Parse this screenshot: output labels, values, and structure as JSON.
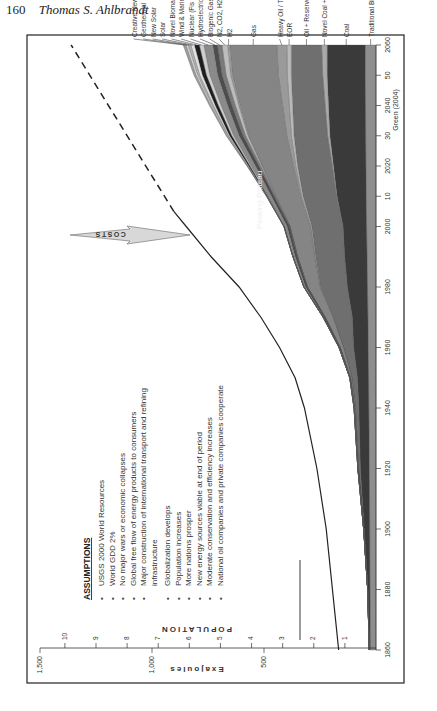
{
  "page_header": {
    "page_number": "160",
    "author": "Thomas S. Ahlbrandt"
  },
  "figure": {
    "orientation": "rotated-90-ccw",
    "source_credit": "Green (2004)",
    "annotation_peaking": "Peaking Plateau",
    "annotation_costs": "COSTS",
    "assumptions": {
      "title": "ASSUMPTIONS",
      "items": [
        "USGS 2000 World Resources",
        "World GDD 2%",
        "No major wars or economic collapses",
        "Global free flow of energy products to consumers",
        "Major construction of international transport and refining infrastructure",
        "Globalization develops",
        "Population increases",
        "More nations prosper",
        "New energy sources viable at end of period",
        "Moderate conservation and efficiency increases",
        "National oil companies and private companies cooperate"
      ]
    }
  },
  "chart_data": {
    "type": "area",
    "stacked": true,
    "title": "",
    "xlabel": "",
    "ylabel": "Exajoules",
    "y2label": "POPULATION",
    "xlim": [
      1860,
      2060
    ],
    "ylim": [
      0,
      1500
    ],
    "y2lim": [
      0,
      10.8
    ],
    "x_ticks": [
      "1860",
      "1880",
      "1900",
      "1920",
      "1940",
      "1960",
      "1980",
      "2000",
      "10",
      "2020",
      "30",
      "2040",
      "50",
      "2060"
    ],
    "y_ticks": [
      "500",
      "1,000",
      "1,500"
    ],
    "y2_ticks": [
      "1",
      "2",
      "3",
      "4",
      "5",
      "6",
      "7",
      "8",
      "9",
      "10"
    ],
    "grid": false,
    "legend_position": "right-of-plot (labels at 2060 edge)",
    "x": [
      1860,
      1880,
      1900,
      1920,
      1940,
      1950,
      1960,
      1970,
      1980,
      1990,
      2000,
      2010,
      2020,
      2030,
      2040,
      2050,
      2060
    ],
    "series": [
      {
        "name": "Traditional Biomass",
        "color": "#8e8e8e",
        "values": [
          25,
          27,
          28,
          30,
          32,
          33,
          35,
          36,
          38,
          40,
          42,
          44,
          45,
          46,
          47,
          48,
          48
        ]
      },
      {
        "name": "Coal",
        "color": "#3a3a3a",
        "values": [
          5,
          10,
          25,
          40,
          45,
          50,
          65,
          70,
          90,
          100,
          105,
          130,
          145,
          160,
          165,
          170,
          170
        ]
      },
      {
        "name": "Novel Coal + CH4",
        "color": "#a9a9a9",
        "values": [
          0,
          0,
          0,
          0,
          0,
          0,
          0,
          0,
          0,
          0,
          0,
          2,
          5,
          10,
          15,
          20,
          25
        ]
      },
      {
        "name": "Oil + Reserve Growth",
        "color": "#6f6f6f",
        "values": [
          0,
          0,
          2,
          8,
          15,
          25,
          45,
          85,
          120,
          130,
          140,
          150,
          155,
          150,
          145,
          140,
          135
        ]
      },
      {
        "name": "EOR",
        "color": "#b9b9b9",
        "values": [
          0,
          0,
          0,
          0,
          0,
          0,
          0,
          1,
          2,
          3,
          4,
          6,
          8,
          12,
          15,
          18,
          20
        ]
      },
      {
        "name": "Heavy Oil / Tar",
        "color": "#9a9a9a",
        "values": [
          0,
          0,
          0,
          0,
          0,
          0,
          0,
          0,
          1,
          2,
          3,
          5,
          10,
          20,
          30,
          40,
          45
        ]
      },
      {
        "name": "Gas",
        "color": "#858585",
        "values": [
          0,
          0,
          0,
          2,
          4,
          6,
          15,
          35,
          55,
          75,
          90,
          110,
          140,
          170,
          190,
          205,
          210
        ]
      },
      {
        "name": "H2",
        "color": "#a0a0a0",
        "values": [
          0,
          0,
          0,
          0,
          0,
          0,
          0,
          0,
          0,
          0,
          0,
          1,
          2,
          4,
          6,
          8,
          10
        ]
      },
      {
        "name": "N2, CO2, H2S Gas",
        "color": "#bdbdbd",
        "values": [
          0,
          0,
          0,
          0,
          0,
          0,
          0,
          0,
          0,
          0,
          0,
          2,
          5,
          10,
          15,
          20,
          25
        ]
      },
      {
        "name": "Biogenic Gas",
        "color": "#7a7a7a",
        "values": [
          0,
          0,
          0,
          0,
          0,
          0,
          0,
          0,
          0,
          1,
          2,
          4,
          8,
          12,
          15,
          18,
          20
        ]
      },
      {
        "name": "Hydroelectric",
        "color": "#4d4d4d",
        "values": [
          0,
          0,
          0,
          1,
          2,
          3,
          5,
          7,
          9,
          10,
          11,
          13,
          15,
          17,
          19,
          20,
          21
        ]
      },
      {
        "name": "Nuclear (Fis Fu)",
        "color": "#8a8a8a",
        "values": [
          0,
          0,
          0,
          0,
          0,
          0,
          0,
          2,
          7,
          10,
          12,
          15,
          20,
          25,
          30,
          35,
          40
        ]
      },
      {
        "name": "Wind & Marine Currents",
        "color": "#cfcfcf",
        "values": [
          0,
          0,
          0,
          0,
          0,
          0,
          0,
          0,
          0,
          0,
          1,
          2,
          5,
          8,
          12,
          15,
          20
        ]
      },
      {
        "name": "Novel Biomass",
        "color": "#1e1e1e",
        "values": [
          0,
          0,
          0,
          0,
          0,
          0,
          0,
          0,
          0,
          0,
          1,
          3,
          6,
          10,
          14,
          18,
          22
        ]
      },
      {
        "name": "Solar",
        "color": "#e2e2e2",
        "values": [
          0,
          0,
          0,
          0,
          0,
          0,
          0,
          0,
          0,
          0,
          0,
          1,
          3,
          5,
          8,
          12,
          16
        ]
      },
      {
        "name": "New Solar",
        "color": "#b3b3b3",
        "values": [
          0,
          0,
          0,
          0,
          0,
          0,
          0,
          0,
          0,
          0,
          0,
          0,
          1,
          3,
          6,
          9,
          12
        ]
      },
      {
        "name": "Geothermal",
        "color": "#d6d6d6",
        "values": [
          0,
          0,
          0,
          0,
          0,
          0,
          0,
          0,
          0,
          0,
          0,
          1,
          2,
          4,
          6,
          8,
          10
        ]
      },
      {
        "name": "Creative New Sources",
        "color": "#9d9d9d",
        "values": [
          0,
          0,
          0,
          0,
          0,
          0,
          0,
          0,
          0,
          0,
          0,
          0,
          1,
          3,
          6,
          9,
          12
        ]
      }
    ],
    "population": {
      "name": "Population (billions)",
      "x": [
        1860,
        1880,
        1900,
        1920,
        1940,
        1950,
        1960,
        1970,
        1980,
        1990,
        2000,
        2005
      ],
      "values": [
        1.2,
        1.4,
        1.6,
        1.9,
        2.3,
        2.6,
        3.1,
        3.7,
        4.4,
        5.3,
        6.1,
        6.5
      ],
      "projection_dashed_x": [
        2005,
        2060
      ],
      "projection_dashed_values": [
        6.5,
        9.8
      ]
    }
  }
}
